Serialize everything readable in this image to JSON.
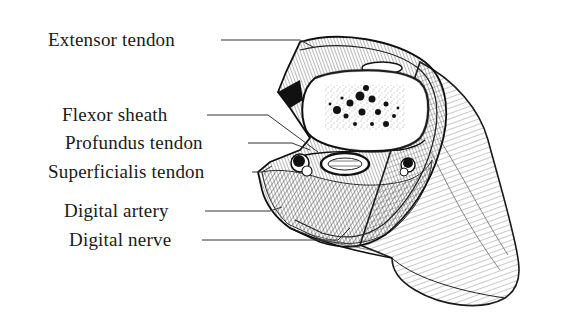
{
  "figure": {
    "colors": {
      "background": "#ffffff",
      "ink": "#1a1a1a",
      "leader_line": "#333333"
    },
    "labels": [
      {
        "id": "extensor-tendon",
        "text": "Extensor tendon"
      },
      {
        "id": "flexor-sheath",
        "text": "Flexor sheath"
      },
      {
        "id": "profundus-tendon",
        "text": "Profundus tendon"
      },
      {
        "id": "superficialis-tendon",
        "text": "Superficialis tendon"
      },
      {
        "id": "digital-artery",
        "text": "Digital artery"
      },
      {
        "id": "digital-nerve",
        "text": "Digital nerve"
      }
    ]
  }
}
